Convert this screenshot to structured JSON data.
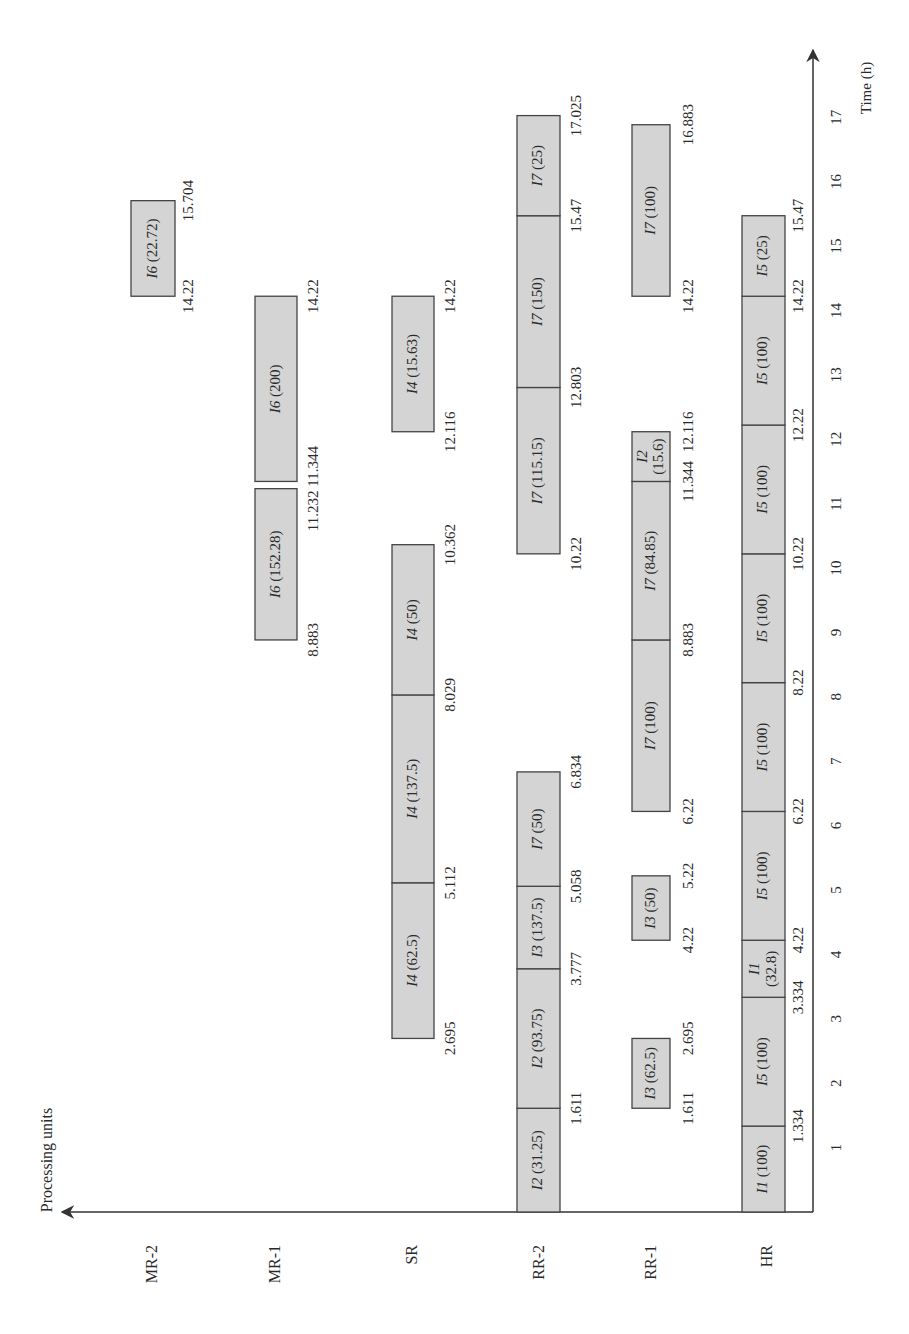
{
  "chart_data": {
    "type": "gantt",
    "title": "",
    "xlabel": "Time (h)",
    "ylabel": "Processing units",
    "orientation": "rotated 90° counter-clockwise (time axis vertical, units horizontal)",
    "x_ticks": [
      1,
      2,
      3,
      4,
      5,
      6,
      7,
      8,
      9,
      10,
      11,
      12,
      13,
      14,
      15,
      16,
      17
    ],
    "xlim": [
      0,
      17.5
    ],
    "units": [
      "HR",
      "RR-1",
      "RR-2",
      "SR",
      "MR-1",
      "MR-2"
    ],
    "tasks": [
      {
        "unit": "HR",
        "task": "I1",
        "amount": "100",
        "start": 0,
        "end": 1.334
      },
      {
        "unit": "HR",
        "task": "I5",
        "amount": "100",
        "start": 1.334,
        "end": 3.334
      },
      {
        "unit": "HR",
        "task": "I1",
        "amount": "32.8",
        "start": 3.334,
        "end": 4.22
      },
      {
        "unit": "HR",
        "task": "I5",
        "amount": "100",
        "start": 4.22,
        "end": 6.22
      },
      {
        "unit": "HR",
        "task": "I5",
        "amount": "100",
        "start": 6.22,
        "end": 8.22
      },
      {
        "unit": "HR",
        "task": "I5",
        "amount": "100",
        "start": 8.22,
        "end": 10.22
      },
      {
        "unit": "HR",
        "task": "I5",
        "amount": "100",
        "start": 10.22,
        "end": 12.22
      },
      {
        "unit": "HR",
        "task": "I5",
        "amount": "100",
        "start": 12.22,
        "end": 14.22
      },
      {
        "unit": "HR",
        "task": "I5",
        "amount": "25",
        "start": 14.22,
        "end": 15.47
      },
      {
        "unit": "RR-1",
        "task": "I3",
        "amount": "62.5",
        "start": 1.611,
        "end": 2.695
      },
      {
        "unit": "RR-1",
        "task": "I3",
        "amount": "50",
        "start": 4.22,
        "end": 5.22
      },
      {
        "unit": "RR-1",
        "task": "I7",
        "amount": "100",
        "start": 6.22,
        "end": 8.883
      },
      {
        "unit": "RR-1",
        "task": "I7",
        "amount": "84.85",
        "start": 8.883,
        "end": 11.344
      },
      {
        "unit": "RR-1",
        "task": "I2",
        "amount": "15.6",
        "start": 11.344,
        "end": 12.116
      },
      {
        "unit": "RR-1",
        "task": "I7",
        "amount": "100",
        "start": 14.22,
        "end": 16.883
      },
      {
        "unit": "RR-2",
        "task": "I2",
        "amount": "31.25",
        "start": 0,
        "end": 1.611
      },
      {
        "unit": "RR-2",
        "task": "I2",
        "amount": "93.75",
        "start": 1.611,
        "end": 3.777
      },
      {
        "unit": "RR-2",
        "task": "I3",
        "amount": "137.5",
        "start": 3.777,
        "end": 5.058
      },
      {
        "unit": "RR-2",
        "task": "I7",
        "amount": "50",
        "start": 5.058,
        "end": 6.834
      },
      {
        "unit": "RR-2",
        "task": "I7",
        "amount": "115.15",
        "start": 10.22,
        "end": 12.803
      },
      {
        "unit": "RR-2",
        "task": "I7",
        "amount": "150",
        "start": 12.803,
        "end": 15.47
      },
      {
        "unit": "RR-2",
        "task": "I7",
        "amount": "25",
        "start": 15.47,
        "end": 17.025
      },
      {
        "unit": "SR",
        "task": "I4",
        "amount": "62.5",
        "start": 2.695,
        "end": 5.112
      },
      {
        "unit": "SR",
        "task": "I4",
        "amount": "137.5",
        "start": 5.112,
        "end": 8.029
      },
      {
        "unit": "SR",
        "task": "I4",
        "amount": "50",
        "start": 8.029,
        "end": 10.362
      },
      {
        "unit": "SR",
        "task": "I4",
        "amount": "15.63",
        "start": 12.116,
        "end": 14.22
      },
      {
        "unit": "MR-1",
        "task": "I6",
        "amount": "152.28",
        "start": 8.883,
        "end": 11.232
      },
      {
        "unit": "MR-1",
        "task": "I6",
        "amount": "200",
        "start": 11.344,
        "end": 14.22
      },
      {
        "unit": "MR-2",
        "task": "I6",
        "amount": "22.72",
        "start": 14.22,
        "end": 15.704
      }
    ],
    "time_annotations": [
      {
        "unit": "HR",
        "values": [
          "1.334",
          "3.334",
          "4.22",
          "6.22",
          "8.22",
          "10.22",
          "12.22",
          "14.22",
          "15.47"
        ]
      },
      {
        "unit": "RR-1",
        "values": [
          "1.611",
          "2.695",
          "4.22",
          "5.22",
          "6.22",
          "8.883",
          "11.344",
          "12.116",
          "14.22",
          "16.883"
        ]
      },
      {
        "unit": "RR-2",
        "values": [
          "1.611",
          "3.777",
          "5.058",
          "6.834",
          "10.22",
          "12.803",
          "15.47",
          "17.025"
        ]
      },
      {
        "unit": "SR",
        "values": [
          "2.695",
          "5.112",
          "8.029",
          "10.362",
          "12.116",
          "14.22"
        ]
      },
      {
        "unit": "MR-1",
        "values": [
          "8.883",
          "11.232 11.344",
          "14.22"
        ]
      },
      {
        "unit": "MR-2",
        "values": [
          "14.22",
          "15.704"
        ]
      }
    ]
  },
  "axes": {
    "y_title": "Processing units",
    "x_title": "Time (h)"
  },
  "colors": {
    "bar_fill": "#d4d4d4",
    "bar_stroke": "#444444",
    "axis": "#333333",
    "text": "#2a2a2a"
  }
}
